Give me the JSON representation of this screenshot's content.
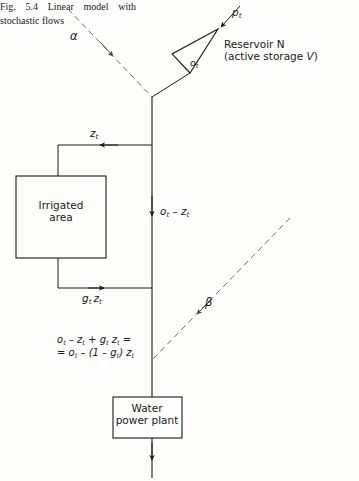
{
  "figure": {
    "caption": "Fig. 5.4 Linear model with stochastic flows",
    "ink_color": "#1a1a1a",
    "dash_color": "#6b6b6b",
    "background": "#fdfdfb"
  },
  "nodes": {
    "reservoir": {
      "name": "Reservoir N",
      "detail_prefix": "(active storage ",
      "detail_var": "V",
      "detail_suffix": ")",
      "shape": "triangle"
    },
    "irrigated_area": {
      "line1": "Irrigated",
      "line2": "area",
      "shape": "rectangle"
    },
    "water_power_plant": {
      "line1": "Water",
      "line2": "power  plant",
      "shape": "rectangle"
    }
  },
  "flow_labels": {
    "inflow_p": {
      "var": "p",
      "sub": "t"
    },
    "release_o": {
      "var": "o",
      "sub": "t"
    },
    "diversion_z": {
      "var": "z",
      "sub": "t"
    },
    "return_g_z": {
      "var": "g",
      "sub": "t",
      "var2": "z",
      "sub2": "t"
    },
    "channel_o_minus_z": {
      "text": "o",
      "sub": "t",
      "op": " – ",
      "text2": "z",
      "sub2": "t"
    },
    "stochastic_alpha": "α",
    "stochastic_beta": "β"
  },
  "equation": {
    "line1": "o",
    "line1_sub1": "t",
    "line1_mid": " – z",
    "line1_sub2": "t",
    "line1_mid2": "  + g",
    "line1_sub3": "t",
    "line1_mid3": " z",
    "line1_sub4": "t",
    "line1_end": " =",
    "line2_start": "= o",
    "line2_sub1": "t",
    "line2_mid": " – (1 – g",
    "line2_sub2": "t",
    "line2_mid2": ") z",
    "line2_sub3": "t"
  }
}
